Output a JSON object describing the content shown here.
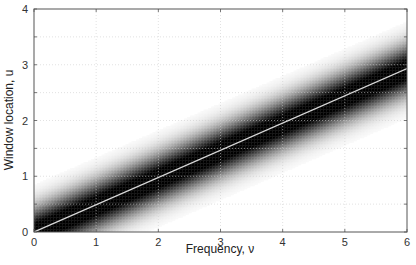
{
  "chart_data": {
    "type": "heatmap",
    "title": "",
    "xlabel": "Frequency, ν",
    "ylabel": "Window location, u",
    "xlim": [
      0,
      6
    ],
    "ylim": [
      0,
      4
    ],
    "xticks": [
      0,
      1,
      2,
      3,
      4,
      5,
      6
    ],
    "yticks": [
      0,
      1,
      2,
      3,
      4
    ],
    "xtick_labels": [
      "0",
      "1",
      "2",
      "3",
      "4",
      "5",
      "6"
    ],
    "ytick_labels": [
      "0",
      "1",
      "2",
      "3",
      "4"
    ],
    "grid": true,
    "grid_style": "dotted light gray",
    "colormap": "grayscale (white = 0, black = max)",
    "band": {
      "description": "Dark Gaussian ridge along u ≈ ν/2, fading to white away from the line",
      "center_line": {
        "slope": 0.488,
        "intercept": 0
      },
      "half_width_u": 0.5,
      "fade_extent_u": 1.0
    },
    "series": [
      {
        "name": "ridge line",
        "color": "#d8d8d8",
        "x": [
          0,
          1,
          2,
          3,
          4,
          5,
          6
        ],
        "y": [
          0,
          0.49,
          0.98,
          1.46,
          1.95,
          2.44,
          2.93
        ]
      }
    ],
    "legend": null
  },
  "colors": {
    "axis": "#555555",
    "grid": "#cfcfcf",
    "ridge_line": "#d8d8d8",
    "band_core": "#000000",
    "background": "#ffffff"
  }
}
